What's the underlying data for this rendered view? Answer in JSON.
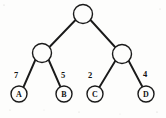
{
  "diagram": {
    "type": "binary-tree",
    "background_color": "#fdfdfc",
    "stroke_color": "#1a1a1a",
    "canvas": {
      "width": 166,
      "height": 118
    },
    "nodes": [
      {
        "id": "root",
        "label": "",
        "cx": 83,
        "cy": 14,
        "r": 9.5,
        "kind": "internal"
      },
      {
        "id": "left",
        "label": "",
        "cx": 42,
        "cy": 53,
        "r": 9.5,
        "kind": "internal"
      },
      {
        "id": "right",
        "label": "",
        "cx": 122,
        "cy": 54,
        "r": 9.5,
        "kind": "internal"
      },
      {
        "id": "leafA",
        "label": "A",
        "cx": 19,
        "cy": 94,
        "r": 8.0,
        "kind": "leaf"
      },
      {
        "id": "leafB",
        "label": "B",
        "cx": 64,
        "cy": 94,
        "r": 8.0,
        "kind": "leaf"
      },
      {
        "id": "leafC",
        "label": "C",
        "cx": 95,
        "cy": 94,
        "r": 8.0,
        "kind": "leaf"
      },
      {
        "id": "leafD",
        "label": "D",
        "cx": 146,
        "cy": 94,
        "r": 8.0,
        "kind": "leaf"
      }
    ],
    "edges": [
      {
        "id": "root-left",
        "from": "root",
        "to": "left",
        "x1": 75.5,
        "y1": 20.0,
        "x2": 49.0,
        "y2": 47.5,
        "weight": ""
      },
      {
        "id": "root-right",
        "from": "root",
        "to": "right",
        "x1": 90.5,
        "y1": 20.0,
        "x2": 115.5,
        "y2": 47.5,
        "weight": ""
      },
      {
        "id": "left-A",
        "from": "left",
        "to": "leafA",
        "x1": 35.5,
        "y1": 59.5,
        "x2": 23.5,
        "y2": 87.0,
        "weight": "7"
      },
      {
        "id": "left-B",
        "from": "left",
        "to": "leafB",
        "x1": 48.5,
        "y1": 59.5,
        "x2": 60.5,
        "y2": 87.0,
        "weight": "5"
      },
      {
        "id": "right-C",
        "from": "right",
        "to": "leafC",
        "x1": 115.5,
        "y1": 60.5,
        "x2": 99.5,
        "y2": 87.0,
        "weight": "2"
      },
      {
        "id": "right-D",
        "from": "right",
        "to": "leafD",
        "x1": 128.5,
        "y1": 60.5,
        "x2": 142.5,
        "y2": 87.0,
        "weight": "4"
      }
    ],
    "weight_labels": [
      {
        "id": "w-A",
        "text": "7",
        "x": 16,
        "y": 76
      },
      {
        "id": "w-B",
        "text": "5",
        "x": 63,
        "y": 76
      },
      {
        "id": "w-C",
        "text": "2",
        "x": 90,
        "y": 76
      },
      {
        "id": "w-D",
        "text": "4",
        "x": 145,
        "y": 75
      }
    ],
    "leaf_labels": [
      {
        "id": "lbl-A",
        "text": "A",
        "x": 19,
        "y": 95
      },
      {
        "id": "lbl-B",
        "text": "B",
        "x": 64,
        "y": 95
      },
      {
        "id": "lbl-C",
        "text": "C",
        "x": 95,
        "y": 95
      },
      {
        "id": "lbl-D",
        "text": "D",
        "x": 146,
        "y": 95
      }
    ]
  }
}
